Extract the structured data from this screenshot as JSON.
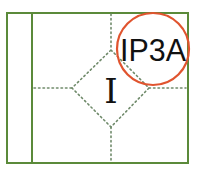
{
  "diagram": {
    "colors": {
      "frame": "#5b8a3a",
      "dotted": "#6f8a6a",
      "circle": "#e0542f",
      "text": "#111111",
      "background": "#ffffff"
    },
    "frame": {
      "x": 7,
      "y": 13,
      "width": 181,
      "height": 150
    },
    "hoist_divider_x": 32,
    "center_label": "I",
    "callout": {
      "label": "IP3A",
      "cx": 153,
      "cy": 49,
      "r": 36
    },
    "diamond": {
      "top": [
        111,
        50
      ],
      "right": [
        149,
        88
      ],
      "bottom": [
        111,
        127
      ],
      "left": [
        72,
        88
      ]
    }
  }
}
